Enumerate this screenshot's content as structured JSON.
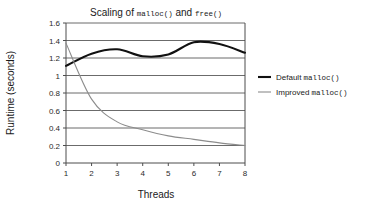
{
  "chart_data": {
    "type": "line",
    "title": "Scaling of malloc() and free()",
    "title_parts": [
      {
        "text": "Scaling of ",
        "mono": false
      },
      {
        "text": "malloc()",
        "mono": true
      },
      {
        "text": " and ",
        "mono": false
      },
      {
        "text": "free()",
        "mono": true
      }
    ],
    "xlabel": "Threads",
    "ylabel": "Runtime (seconds)",
    "xlim": [
      1,
      8
    ],
    "ylim": [
      0,
      1.6
    ],
    "xticks": [
      "1",
      "2",
      "3",
      "4",
      "5",
      "6",
      "7",
      "8"
    ],
    "xtick_values": [
      1,
      2,
      3,
      4,
      5,
      6,
      7,
      8
    ],
    "yticks": [
      "0",
      "0.2",
      "0.4",
      "0.6",
      "0.8",
      "1",
      "1.2",
      "1.4",
      "1.6"
    ],
    "ytick_values": [
      0,
      0.2,
      0.4,
      0.6,
      0.8,
      1.0,
      1.2,
      1.4,
      1.6
    ],
    "grid": "horizontal",
    "legend_position": "right",
    "x": [
      1,
      2,
      3,
      4,
      5,
      6,
      7,
      8
    ],
    "series": [
      {
        "name": "Default malloc()",
        "name_parts": [
          {
            "text": "Default ",
            "mono": false
          },
          {
            "text": "malloc()",
            "mono": true
          }
        ],
        "color": "#111111",
        "width": 2.1,
        "values": [
          1.11,
          1.25,
          1.3,
          1.22,
          1.24,
          1.38,
          1.36,
          1.26
        ]
      },
      {
        "name": "Improved malloc()",
        "name_parts": [
          {
            "text": "Improved ",
            "mono": false
          },
          {
            "text": "malloc()",
            "mono": true
          }
        ],
        "color": "#8c8c8c",
        "width": 1.1,
        "values": [
          1.37,
          0.73,
          0.47,
          0.38,
          0.31,
          0.27,
          0.23,
          0.2
        ]
      }
    ]
  },
  "figure": {
    "background": "#ffffff",
    "axis_color": "#4d4d4d",
    "grid_color": "#5a5a5a"
  }
}
